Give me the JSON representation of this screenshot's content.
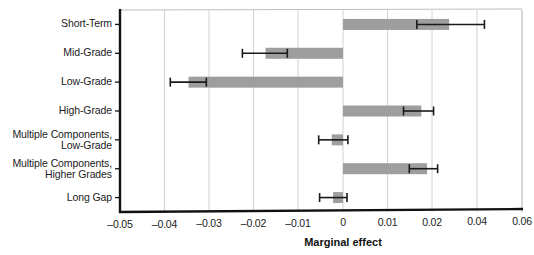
{
  "chart_data": {
    "type": "bar",
    "orientation": "horizontal",
    "title": "",
    "xlabel": "Marginal effect",
    "ylabel": "",
    "grid": true,
    "legend": null,
    "xlim": [
      -0.05,
      0.06
    ],
    "xticks": [
      -0.05,
      -0.04,
      -0.03,
      -0.02,
      -0.01,
      0,
      0.01,
      0.02,
      0.04,
      0.06
    ],
    "xticklabels": [
      "–0.05",
      "–0.04",
      "–0.03",
      "–0.02",
      "–0.01",
      "0",
      "0.01",
      "0.02",
      "0.04",
      "0.06"
    ],
    "note_axis": "x-axis is piecewise: linear from -0.05 to 0.02, then compressed for 0.04 and 0.06",
    "categories": [
      "Short-Term",
      "Mid-Grade",
      "Low-Grade",
      "High-Grade",
      "Multiple Components,\nLow-Grade",
      "Multiple Components,\nHigher Grades",
      "Long Gap"
    ],
    "values": [
      0.0276,
      -0.0173,
      -0.0346,
      0.0176,
      -0.0025,
      0.0189,
      -0.0022
    ],
    "ci_low": [
      0.0166,
      -0.0225,
      -0.0387,
      0.0136,
      -0.0054,
      0.0149,
      -0.0052
    ],
    "ci_high": [
      0.0433,
      -0.0124,
      -0.0306,
      0.0207,
      0.0011,
      0.0225,
      0.0009
    ],
    "bar_color": "#9e9e9e",
    "errorbar_color": "#1a1a1a",
    "grid_color": "#d2d2d2",
    "axis_color": "#111111"
  },
  "axis": {
    "x_title": "Marginal effect"
  }
}
